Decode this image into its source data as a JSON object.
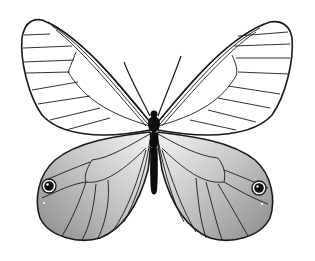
{
  "image": {
    "subject": "butterfly illustration",
    "style": "black line drawing with grayscale shaded hindwings",
    "background": "#ffffff",
    "colors": {
      "line": "#1a1a1a",
      "body": "#0d0d0d",
      "shade_dark": "#8c8c8c",
      "shade_light": "#f2f2f2"
    }
  }
}
